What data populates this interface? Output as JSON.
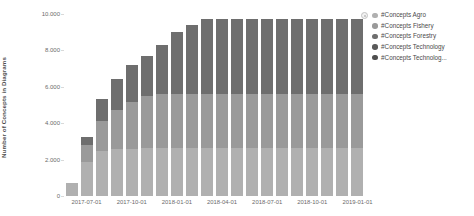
{
  "chart_data": {
    "type": "bar",
    "stacked": true,
    "title": "",
    "subtitle": "",
    "xlabel": "",
    "ylabel": "Number of Concepts in Diagrams",
    "ylim": [
      0,
      10000
    ],
    "y_ticks": [
      "0",
      "2.000",
      "4.000",
      "6.000",
      "8.000",
      "10.000"
    ],
    "y_tick_values": [
      0,
      2000,
      4000,
      6000,
      8000,
      10000
    ],
    "grid": false,
    "legend_position": "right",
    "x_tick_labels": [
      "2017-07-01",
      "2017-10-01",
      "2018-01-01",
      "2018-04-01",
      "2018-07-01",
      "2018-10-01",
      "2019-01-01"
    ],
    "x_tick_positions": [
      1,
      4,
      7,
      10,
      13,
      16,
      19
    ],
    "categories": [
      "2017-06-01",
      "2017-07-01",
      "2017-08-01",
      "2017-09-01",
      "2017-10-01",
      "2017-11-01",
      "2017-12-01",
      "2018-01-01",
      "2018-02-01",
      "2018-03-01",
      "2018-04-01",
      "2018-05-01",
      "2018-06-01",
      "2018-07-01",
      "2018-08-01",
      "2018-09-01",
      "2018-10-01",
      "2018-11-01",
      "2018-12-01",
      "2019-01-01"
    ],
    "series": [
      {
        "name": "#Concepts Agro",
        "color": "#b0b0b0",
        "values": [
          700,
          1850,
          2450,
          2560,
          2600,
          2620,
          2620,
          2620,
          2620,
          2620,
          2620,
          2620,
          2620,
          2620,
          2620,
          2620,
          2620,
          2620,
          2620,
          2620
        ]
      },
      {
        "name": "#Concepts Fishery",
        "color": "#9a9a9a",
        "values": [
          0,
          950,
          1650,
          2150,
          2560,
          2900,
          2980,
          3000,
          3000,
          3000,
          3000,
          3000,
          3000,
          3000,
          3000,
          3000,
          3000,
          3000,
          3000,
          3000
        ]
      },
      {
        "name": "#Concepts Forestry",
        "color": "#6e6e6e",
        "values": [
          0,
          450,
          1250,
          1700,
          2040,
          2180,
          2700,
          3380,
          3800,
          4080,
          4080,
          4080,
          4080,
          4080,
          4080,
          4080,
          4080,
          4080,
          4080,
          4080
        ]
      },
      {
        "name": "#Concepts Technology",
        "color": "#5a5a5a",
        "values": [
          0,
          0,
          0,
          0,
          0,
          0,
          0,
          0,
          0,
          0,
          0,
          0,
          0,
          0,
          0,
          0,
          0,
          0,
          0,
          0
        ]
      },
      {
        "name": "#Concepts Technolog...",
        "color": "#4f4f4f",
        "values": [
          0,
          0,
          0,
          0,
          0,
          0,
          0,
          0,
          0,
          0,
          0,
          0,
          0,
          0,
          0,
          0,
          0,
          0,
          0,
          0
        ]
      }
    ],
    "totals": [
      700,
      3250,
      5350,
      6410,
      7200,
      7700,
      8300,
      9000,
      9420,
      9700,
      9700,
      9700,
      9700,
      9700,
      9700,
      9700,
      9700,
      9700,
      9700,
      9700
    ],
    "bar_color_stack": [
      "#b0b0b0",
      "#9a9a9a",
      "#6e6e6e"
    ]
  },
  "legend": {
    "items": [
      {
        "label": "#Concepts Agro",
        "color": "#b0b0b0"
      },
      {
        "label": "#Concepts Fishery",
        "color": "#9a9a9a"
      },
      {
        "label": "#Concepts Forestry",
        "color": "#6e6e6e"
      },
      {
        "label": "#Concepts Technology",
        "color": "#5a5a5a"
      },
      {
        "label": "#Concepts Technolog...",
        "color": "#4f4f4f"
      }
    ],
    "toggle_icon": "legend-toggle-icon"
  }
}
